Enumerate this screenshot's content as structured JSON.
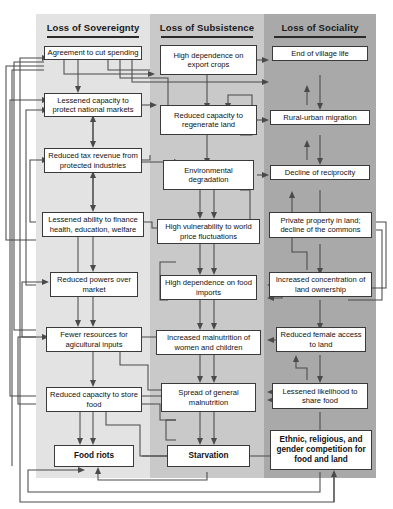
{
  "figure": {
    "type": "flowchart",
    "title": "",
    "columns": [
      {
        "id": "sovereignty",
        "label": "Loss of Sovereignty",
        "band_color": "#e3e3e3"
      },
      {
        "id": "subsistence",
        "label": "Loss of Subsistence",
        "band_color": "#c9c9c9"
      },
      {
        "id": "sociality",
        "label": "Loss of Sociality",
        "band_color": "#a9a9a9"
      }
    ]
  },
  "nodes": [
    {
      "id": "n1",
      "column": "sovereignty",
      "label": "Agreement to cut spending",
      "emphasis": "normal"
    },
    {
      "id": "n2",
      "column": "sovereignty",
      "label": "Lessened capacity to protect national markets",
      "emphasis": "normal"
    },
    {
      "id": "n3",
      "column": "sovereignty",
      "label": "Reduced tax revenue from protected industries",
      "emphasis": "normal"
    },
    {
      "id": "n4",
      "column": "sovereignty",
      "label": "Lessened ability to finance health, education, welfare",
      "emphasis": "normal"
    },
    {
      "id": "n5",
      "column": "sovereignty",
      "label": "Reduced powers over market",
      "emphasis": "normal"
    },
    {
      "id": "n6",
      "column": "sovereignty",
      "label": "Fewer resources for agicultural inputs",
      "emphasis": "normal"
    },
    {
      "id": "n7",
      "column": "sovereignty",
      "label": "Reduced capacity to store food",
      "emphasis": "normal"
    },
    {
      "id": "n8",
      "column": "sovereignty",
      "label": "Food riots",
      "emphasis": "bold"
    },
    {
      "id": "m1",
      "column": "subsistence",
      "label": "High dependence on export crops",
      "emphasis": "normal"
    },
    {
      "id": "m2",
      "column": "subsistence",
      "label": "Reduced capacity to regenerate land",
      "emphasis": "normal"
    },
    {
      "id": "m3",
      "column": "subsistence",
      "label": "Environmental degradation",
      "emphasis": "normal"
    },
    {
      "id": "m4",
      "column": "subsistence",
      "label": "High vulnerability to world price fluctuations",
      "emphasis": "normal"
    },
    {
      "id": "m5",
      "column": "subsistence",
      "label": "High dependence on food imports",
      "emphasis": "normal"
    },
    {
      "id": "m6",
      "column": "subsistence",
      "label": "Increased malnutrition of women and children",
      "emphasis": "normal"
    },
    {
      "id": "m7",
      "column": "subsistence",
      "label": "Spread of general malnutrition",
      "emphasis": "normal"
    },
    {
      "id": "m8",
      "column": "subsistence",
      "label": "Starvation",
      "emphasis": "bold"
    },
    {
      "id": "r1",
      "column": "sociality",
      "label": "End of village life",
      "emphasis": "normal"
    },
    {
      "id": "r2",
      "column": "sociality",
      "label": "Rural-urban migration",
      "emphasis": "normal"
    },
    {
      "id": "r3",
      "column": "sociality",
      "label": "Decline of reciprocity",
      "emphasis": "normal"
    },
    {
      "id": "r4",
      "column": "sociality",
      "label": "Private property in land; decline of the commons",
      "emphasis": "normal"
    },
    {
      "id": "r5",
      "column": "sociality",
      "label": "Increased concentration of land ownership",
      "emphasis": "normal"
    },
    {
      "id": "r6",
      "column": "sociality",
      "label": "Reduced female access to land",
      "emphasis": "normal"
    },
    {
      "id": "r7",
      "column": "sociality",
      "label": "Lessened likelihood to share food",
      "emphasis": "normal"
    },
    {
      "id": "r8",
      "column": "sociality",
      "label": "Ethnic, religious, and gender competition for food and land",
      "emphasis": "bold"
    }
  ]
}
